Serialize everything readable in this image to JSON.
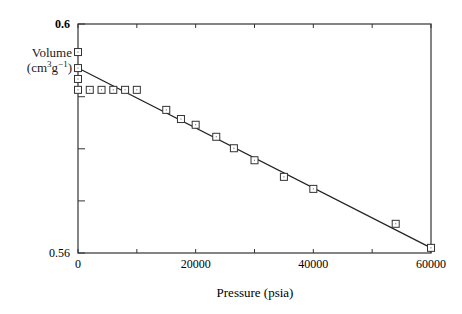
{
  "chart_data": {
    "type": "scatter",
    "title": "",
    "xlabel": "Pressure (psia)",
    "ylabel_line1": "Volume",
    "ylabel_line2_base": "(cm",
    "ylabel_line2_sup1": "3",
    "ylabel_line2_mid": "g",
    "ylabel_line2_sup2": "−1",
    "ylabel_line2_end": ")",
    "xlim": [
      0,
      60000
    ],
    "ylim": [
      0.56,
      0.6
    ],
    "x_tick_labels": [
      "0",
      "20000",
      "40000",
      "60000"
    ],
    "x_ticks": [
      0,
      10000,
      20000,
      30000,
      40000,
      50000,
      60000
    ],
    "y_tick_labels": [
      "0.6",
      "0.56"
    ],
    "y_ticks": [
      0.56,
      0.5691,
      0.5782,
      0.5873,
      0.6
    ],
    "grid": false,
    "series": [
      {
        "name": "measured",
        "marker": "square",
        "x": [
          0,
          0,
          0,
          0,
          2000,
          4000,
          6000,
          8000,
          10000,
          15000,
          17500,
          20000,
          23500,
          26500,
          30000,
          35000,
          40000,
          54000,
          60000
        ],
        "y": [
          0.5951,
          0.5923,
          0.5904,
          0.5885,
          0.5885,
          0.5885,
          0.5885,
          0.5885,
          0.5885,
          0.585,
          0.5834,
          0.5824,
          0.5803,
          0.5783,
          0.5762,
          0.5733,
          0.5712,
          0.5651,
          0.5609
        ]
      },
      {
        "name": "linear fit",
        "type": "line",
        "x": [
          0,
          60000
        ],
        "y": [
          0.5923,
          0.5609
        ]
      }
    ]
  }
}
